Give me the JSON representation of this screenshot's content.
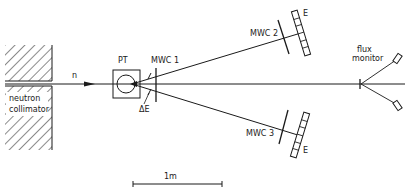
{
  "labels": {
    "neutron": "n",
    "collimator_line1": "neutron",
    "collimator_line2": "collimator",
    "target": "PT",
    "mwc1": "MWC 1",
    "delta_e": "ΔE",
    "mwc2": "MWC 2",
    "mwc3": "MWC 3",
    "e_top": "E",
    "e_bottom": "E",
    "flux_line1": "flux",
    "flux_line2": "monitor",
    "scale": "1m"
  },
  "colors": {
    "ink": "#1a1a1a",
    "background": "#ffffff"
  }
}
